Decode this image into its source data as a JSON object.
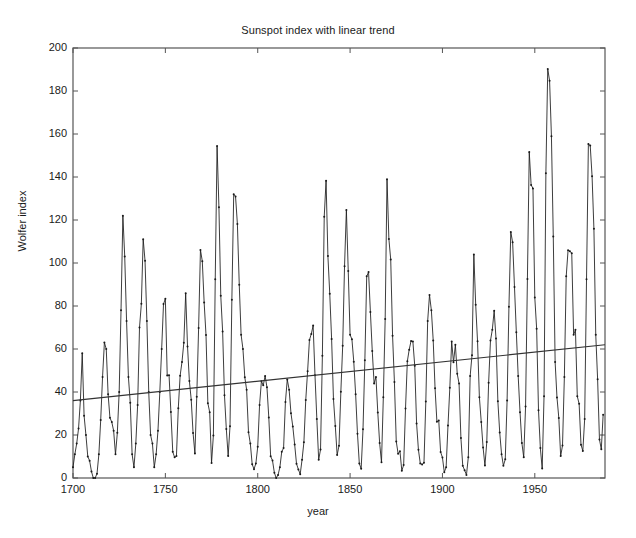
{
  "chart_data": {
    "type": "line",
    "title": "Sunspot index with linear trend",
    "xlabel": "year",
    "ylabel": "Wolfer index",
    "xlim": [
      1700,
      1988
    ],
    "ylim": [
      0,
      200
    ],
    "xticks": [
      1700,
      1750,
      1800,
      1850,
      1900,
      1950
    ],
    "yticks": [
      0,
      20,
      40,
      60,
      80,
      100,
      120,
      140,
      160,
      180,
      200
    ],
    "grid": false,
    "legend": null,
    "series": [
      {
        "name": "Wolfer sunspot index",
        "style": "line-with-dot-markers",
        "color": "#1a1a1a",
        "x_start": 1700,
        "x_step": 1,
        "values": [
          5,
          11,
          16,
          23,
          36,
          58,
          29,
          20,
          10,
          8,
          3,
          0,
          0,
          2,
          11,
          27,
          47,
          63,
          60,
          39,
          28,
          26,
          22,
          11,
          21,
          40,
          78,
          122,
          103,
          73,
          47,
          35,
          11,
          5,
          16,
          34,
          70,
          81,
          111,
          101,
          73,
          40,
          20,
          16,
          5,
          11,
          22,
          40,
          60,
          80.9,
          83.4,
          47.7,
          47.8,
          30.7,
          12.2,
          9.6,
          10.2,
          32.4,
          47.6,
          54,
          62.9,
          85.9,
          61.2,
          45.1,
          36.4,
          20.9,
          11.4,
          37.8,
          69.8,
          106.1,
          100.8,
          81.6,
          66.5,
          34.8,
          30.6,
          7,
          19.8,
          92.5,
          154.4,
          125.9,
          84.8,
          68.1,
          38.5,
          22.8,
          10.2,
          24.1,
          82.9,
          132,
          130.9,
          118.1,
          89.9,
          66.6,
          60,
          46.9,
          41,
          21.3,
          16,
          6.4,
          4.1,
          6.8,
          14.5,
          34,
          45,
          43.1,
          47.5,
          42.2,
          28.1,
          10.1,
          8.1,
          2.5,
          0,
          1.4,
          5,
          12.2,
          13.9,
          35.4,
          45.8,
          41.1,
          30.1,
          23.9,
          15.6,
          6.6,
          4,
          1.8,
          8.5,
          16.6,
          36.3,
          49.6,
          64.2,
          67,
          70.9,
          47.8,
          27.5,
          8.5,
          13.2,
          56.9,
          121.5,
          138.3,
          103.2,
          85.7,
          64.6,
          36.7,
          24.2,
          10.7,
          15,
          40.1,
          61.5,
          98.5,
          124.7,
          96.3,
          66.6,
          64.5,
          54.1,
          39,
          20.6,
          6.7,
          4.3,
          22.7,
          54.8,
          93.8,
          95.8,
          77.2,
          59.1,
          44,
          47,
          30.5,
          16.3,
          7.3,
          37.6,
          74,
          139,
          111.2,
          101.6,
          66.2,
          44.7,
          17,
          11.3,
          12.4,
          3.4,
          6,
          32.3,
          54.3,
          59.7,
          63.7,
          63.5,
          52.2,
          25.4,
          13.1,
          6.8,
          6.3,
          7.1,
          35.6,
          73,
          85.1,
          78,
          64,
          41.8,
          26.2,
          26.7,
          12.1,
          9.5,
          2.7,
          5,
          24.4,
          42,
          63.5,
          53.8,
          62,
          48.5,
          43.9,
          18.6,
          5.7,
          3.6,
          1.4,
          9.6,
          47.4,
          57.1,
          103.9,
          80.6,
          63.6,
          37.6,
          26.1,
          14.2,
          5.8,
          16.7,
          44.3,
          63.9,
          69,
          77.8,
          64.9,
          35.7,
          21.2,
          11.1,
          5.7,
          8.7,
          36.1,
          79.7,
          114.4,
          109.6,
          88.8,
          67.8,
          47.5,
          30.6,
          16.3,
          9.6,
          33.2,
          92.6,
          151.6,
          136.3,
          134.7,
          83.9,
          69.4,
          31.5,
          13.9,
          4.4,
          38,
          141.7,
          190.2,
          184.8,
          159,
          112.3,
          53.9,
          37.5,
          27.9,
          10.2,
          15.1,
          47,
          93.8,
          105.9,
          105.5,
          104.5,
          66.6,
          68.9,
          38,
          34.5,
          15.5,
          12.6,
          27.5,
          92.5,
          155.4,
          154.6,
          140.4,
          115.9,
          66.6,
          45.9,
          17.9,
          13.4,
          29.4
        ]
      },
      {
        "name": "linear trend",
        "style": "straight-line",
        "color": "#333333",
        "endpoints": [
          {
            "x": 1700,
            "y": 36
          },
          {
            "x": 1988,
            "y": 62
          }
        ]
      }
    ]
  },
  "figure": {
    "title": "Sunspot index with linear trend",
    "xlabel": "year",
    "ylabel": "Wolfer index",
    "y_tick_labels": [
      "200",
      "180",
      "160",
      "140",
      "120",
      "100",
      "80",
      "60",
      "40",
      "20",
      "0"
    ],
    "x_tick_labels": [
      "1700",
      "1750",
      "1800",
      "1850",
      "1900",
      "1950"
    ]
  }
}
